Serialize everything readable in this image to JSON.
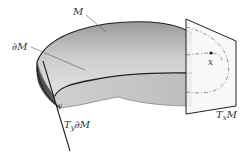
{
  "figure": {
    "labels": {
      "manifold": "M",
      "boundary": "∂M",
      "point_x": "x",
      "point_y": "y",
      "tangent_space_x": "TₓM",
      "tangent_boundary_y": "T_y∂M"
    },
    "label_parts": {
      "tangent_space_x": {
        "base": "T",
        "sub": "x",
        "tail": "M"
      },
      "tangent_boundary_y": {
        "base": "T",
        "sub": "y",
        "tail": "∂M"
      }
    },
    "colors": {
      "stroke": "#222222",
      "surface_light": "#d8d8d8",
      "surface_mid": "#a8a8a8",
      "surface_dark": "#555555",
      "plane_fill": "#f7f7f7",
      "dashed_curve": "#888888",
      "label": "#333333"
    }
  }
}
